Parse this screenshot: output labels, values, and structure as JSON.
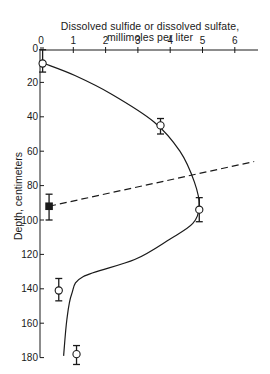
{
  "chart_data": {
    "type": "line",
    "title": "Dissolved sulfide or dissolved sulfate, millimoles per liter",
    "title_lines": [
      "Dissolved sulfide or dissolved sulfate,",
      "millimoles per liter"
    ],
    "xlabel": "Dissolved sulfide or dissolved sulfate, millimoles per liter",
    "ylabel": "Depth, centimeters",
    "x_axis_position": "top",
    "y_inverted": true,
    "xlim": [
      0,
      6.8
    ],
    "ylim": [
      0,
      180
    ],
    "x_ticks": [
      0,
      1,
      2,
      3,
      4,
      5,
      6
    ],
    "y_ticks": [
      0,
      20,
      40,
      60,
      80,
      100,
      120,
      140,
      160,
      180
    ],
    "grid": false,
    "series": [
      {
        "name": "Dissolved sulfide (open circles, measured)",
        "marker": "open-circle",
        "points": [
          {
            "x": 0.05,
            "depth": 9,
            "err_low": 1,
            "err_high": 14
          },
          {
            "x": 3.7,
            "depth": 45,
            "err_low": 41,
            "err_high": 50
          },
          {
            "x": 4.9,
            "depth": 94,
            "err_low": 87,
            "err_high": 101
          },
          {
            "x": 0.55,
            "depth": 141,
            "err_low": 134,
            "err_high": 147
          },
          {
            "x": 1.1,
            "depth": 178,
            "err_low": 173,
            "err_high": 184
          }
        ]
      },
      {
        "name": "Dissolved sulfate (filled square, measured)",
        "marker": "filled-square",
        "points": [
          {
            "x": 0.25,
            "depth": 92,
            "err_low": 85,
            "err_high": 100
          }
        ]
      },
      {
        "name": "Sulfide fitted curve (solid)",
        "style": "solid",
        "points": [
          {
            "x": 0.1,
            "depth": 9
          },
          {
            "x": 1.05,
            "depth": 16
          },
          {
            "x": 2.2,
            "depth": 27
          },
          {
            "x": 3.5,
            "depth": 43
          },
          {
            "x": 4.3,
            "depth": 60
          },
          {
            "x": 4.75,
            "depth": 78
          },
          {
            "x": 4.9,
            "depth": 92
          },
          {
            "x": 4.7,
            "depth": 102
          },
          {
            "x": 4.0,
            "depth": 111
          },
          {
            "x": 2.9,
            "depth": 123
          },
          {
            "x": 1.3,
            "depth": 133
          },
          {
            "x": 0.95,
            "depth": 143
          },
          {
            "x": 0.8,
            "depth": 158
          },
          {
            "x": 0.7,
            "depth": 179
          }
        ]
      },
      {
        "name": "Sulfate trend (dashed)",
        "style": "dashed",
        "points": [
          {
            "x": 0.25,
            "depth": 92
          },
          {
            "x": 6.6,
            "depth": 66
          }
        ]
      }
    ]
  }
}
